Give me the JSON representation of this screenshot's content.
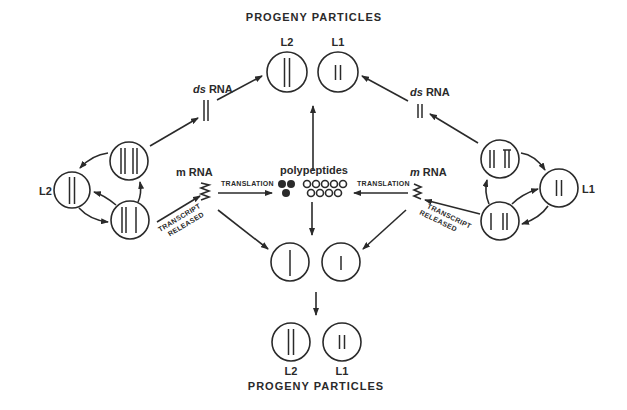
{
  "diagram": {
    "top_title": "PROGENY PARTICLES",
    "bottom_title": "PROGENY PARTICLES",
    "top_labels": {
      "l2": "L2",
      "l1": "L1"
    },
    "bottom_labels": {
      "l2": "L2",
      "l1": "L1"
    },
    "left_label": "L2",
    "right_label": "L1",
    "ds_rna_left": {
      "prefix": "ds",
      "suffix": "RNA"
    },
    "ds_rna_right": {
      "prefix": "ds",
      "suffix": "RNA"
    },
    "m_rna_left": {
      "prefix": "m",
      "suffix": "RNA"
    },
    "m_rna_right": {
      "prefix": "m",
      "suffix": "RNA"
    },
    "translation_left": "TRANSLATION",
    "translation_right": "TRANSLATION",
    "transcript_left": [
      "TRANSCRIPT",
      "RELEASED"
    ],
    "transcript_right": [
      "TRANSCRIPT",
      "RELEASED"
    ],
    "polypeptides": "polypeptides",
    "colors": {
      "ink": "#2a2a2a",
      "background": "#ffffff"
    }
  }
}
